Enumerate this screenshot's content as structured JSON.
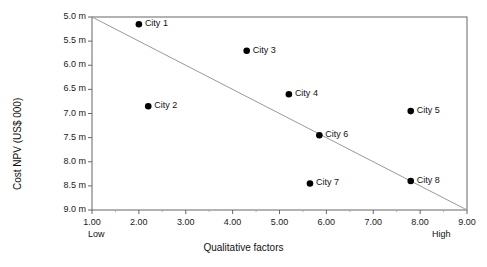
{
  "chart_data": {
    "type": "scatter",
    "title": "",
    "xlabel": "Qualitative factors",
    "ylabel": "Cost NPV (US$ 000)",
    "xlim": [
      1.0,
      9.0
    ],
    "ylim": [
      5.0,
      9.0
    ],
    "y_axis_inverted": true,
    "grid": false,
    "legend": "none",
    "x_tick_labels": [
      "1.00",
      "2.00",
      "3.00",
      "4.00",
      "5.00",
      "6.00",
      "7.00",
      "8.00",
      "9.00"
    ],
    "x_tick_values": [
      1.0,
      2.0,
      3.0,
      4.0,
      5.0,
      6.0,
      7.0,
      8.0,
      9.0
    ],
    "y_tick_labels": [
      "5.0 m",
      "5.5 m",
      "6.0 m",
      "6.5 m",
      "7.0 m",
      "7.5 m",
      "8.0 m",
      "8.5 m",
      "9.0 m"
    ],
    "y_tick_values": [
      5.0,
      5.5,
      6.0,
      6.5,
      7.0,
      7.5,
      8.0,
      8.5,
      9.0
    ],
    "x_axis_anchor_low": "Low",
    "x_axis_anchor_high": "High",
    "points": [
      {
        "label": "City 1",
        "x": 2.0,
        "y": 5.15
      },
      {
        "label": "City 2",
        "x": 2.2,
        "y": 6.85
      },
      {
        "label": "City 3",
        "x": 4.3,
        "y": 5.7
      },
      {
        "label": "City 4",
        "x": 5.2,
        "y": 6.6
      },
      {
        "label": "City 5",
        "x": 7.8,
        "y": 6.95
      },
      {
        "label": "City 6",
        "x": 5.85,
        "y": 7.45
      },
      {
        "label": "City 7",
        "x": 5.65,
        "y": 8.45
      },
      {
        "label": "City 8",
        "x": 7.8,
        "y": 8.4
      }
    ],
    "trendline": {
      "x0": 1.0,
      "y0": 5.0,
      "x1": 9.0,
      "y1": 9.0,
      "color": "#999999"
    },
    "marker_color": "#000000",
    "axis_color": "#666666"
  }
}
